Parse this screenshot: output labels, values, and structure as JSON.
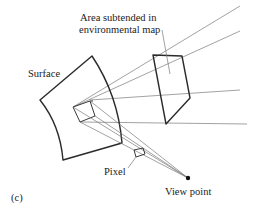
{
  "figure": {
    "panel_label": "(c)",
    "labels": {
      "area_line1": "Area subtended in",
      "area_line2": "environmental map",
      "surface": "Surface",
      "pixel": "Pixel",
      "view_point": "View point"
    }
  }
}
